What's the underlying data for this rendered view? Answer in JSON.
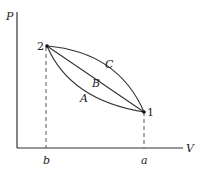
{
  "diagram": {
    "type": "pressure-volume diagram",
    "axes": {
      "y_label": "P",
      "x_label": "V"
    },
    "points": [
      {
        "id": "2",
        "label": "2",
        "volume_tick": "b"
      },
      {
        "id": "1",
        "label": "1",
        "volume_tick": "a"
      }
    ],
    "paths": [
      {
        "id": "A",
        "label": "A",
        "shape": "concave-up curve from 2 to 1"
      },
      {
        "id": "B",
        "label": "B",
        "shape": "straight line from 2 to 1"
      },
      {
        "id": "C",
        "label": "C",
        "shape": "concave-down curve from 2 to 1"
      }
    ],
    "tick_labels": {
      "b": "b",
      "a": "a"
    }
  }
}
